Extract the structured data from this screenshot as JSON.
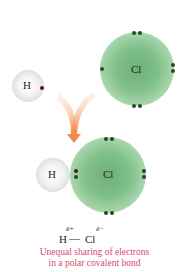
{
  "top": {
    "h_label": "H",
    "cl_label": "Cl"
  },
  "bottom": {
    "h_label": "H",
    "cl_label": "Cl"
  },
  "formula": {
    "h": "H",
    "bond": "—",
    "cl": "Cl",
    "delta_plus": "δ+",
    "delta_minus": "δ−"
  },
  "caption": {
    "line1": "Unequal sharing of electrons",
    "line2": "in a polar covalent bond"
  },
  "colors": {
    "caption": "#d24a6a",
    "arrow": "#f08a4b",
    "chlorine": "#7fbf88",
    "electron_cl": "#1f4d22",
    "electron_h": "#5a1518"
  }
}
